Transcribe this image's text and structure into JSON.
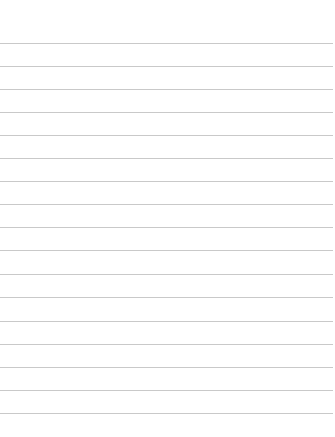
{
  "page": {
    "type": "blank-lined-paper",
    "background_color": "#ffffff",
    "rule_color": "#c9c9c9",
    "rules": [
      43,
      66,
      89,
      112,
      135,
      158,
      181,
      204,
      227,
      250,
      274,
      297,
      321,
      344,
      367,
      390,
      413
    ]
  }
}
